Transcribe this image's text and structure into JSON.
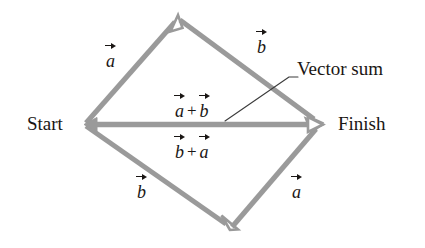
{
  "figure": {
    "background_color": "#ffffff",
    "vector_stroke_color": "#9a9a9a",
    "text_color": "#1a1614",
    "leader_line_color": "#3b3b3b",
    "width": 425,
    "height": 248
  },
  "endpoints": {
    "start_label": "Start",
    "finish_label": "Finish"
  },
  "callout": {
    "label": "Vector sum"
  },
  "vector_labels": {
    "top_left": "a",
    "top_right": "b",
    "bottom_left": "b",
    "bottom_right": "a"
  },
  "sum_labels": {
    "above": {
      "first": "a",
      "operator": "+",
      "second": "b"
    },
    "below": {
      "first": "b",
      "operator": "+",
      "second": "a"
    }
  },
  "geometry": {
    "start_point": "85,124",
    "top_point": "178,18",
    "finish_point": "320,124",
    "bottom_point": "229,228"
  }
}
